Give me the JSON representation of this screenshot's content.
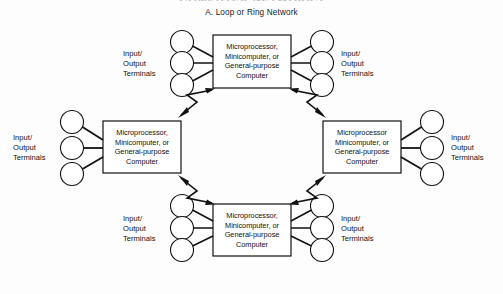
{
  "figure": {
    "title": "COMPUTER NETWORKS",
    "subtitle": "A.  Loop or Ring Network",
    "background_color": "#fdfdfd",
    "stroke_color": "#111111"
  },
  "nodes": [
    {
      "id": "top",
      "position": "top",
      "lines": [
        "Microprocessor,",
        "Minicomputer, or",
        "General-purpose",
        "Computer"
      ],
      "text": "Microprocessor, Minicomputer, or General-purpose Computer"
    },
    {
      "id": "left",
      "position": "left",
      "lines": [
        "Microprocessor,",
        "Minicomputer, or",
        "General-purpose",
        "Computer"
      ],
      "text": "Microprocessor, Minicomputer, or General-purpose Computer"
    },
    {
      "id": "right",
      "position": "right",
      "lines": [
        "Microprocessor",
        "Minicomputer, or",
        "General-purpose",
        "Computer"
      ],
      "text": "Microprocessor Minicomputer, or General-purpose Computer"
    },
    {
      "id": "bottom",
      "position": "bottom",
      "lines": [
        "Microprocessor,",
        "Minicomputer, or",
        "General-purpose",
        "Computer"
      ],
      "text": "Microprocessor, Minicomputer, or General-purpose Computer"
    }
  ],
  "terminal_groups": [
    {
      "id": "top-left",
      "lines": [
        "Input/",
        "Output",
        "Terminals"
      ],
      "terminal_count": 3
    },
    {
      "id": "top-right",
      "lines": [
        "Input/",
        "Output",
        "Terminals"
      ],
      "terminal_count": 3
    },
    {
      "id": "left",
      "lines": [
        "Input/",
        "Output",
        "Terminals"
      ],
      "terminal_count": 3
    },
    {
      "id": "right",
      "lines": [
        "Input/",
        "Output",
        "Terminals"
      ],
      "terminal_count": 3
    },
    {
      "id": "bottom-left",
      "lines": [
        "Input/",
        "Output",
        "Terminals"
      ],
      "terminal_count": 3
    },
    {
      "id": "bottom-right",
      "lines": [
        "Input/",
        "Output",
        "Terminals"
      ],
      "terminal_count": 3
    }
  ],
  "ring_links": [
    {
      "id": "top-left-link",
      "from": "top",
      "to": "left",
      "style": "zigzag-double-arrow"
    },
    {
      "id": "top-right-link",
      "from": "top",
      "to": "right",
      "style": "zigzag-double-arrow"
    },
    {
      "id": "bottom-left-link",
      "from": "left",
      "to": "bottom",
      "style": "zigzag-double-arrow"
    },
    {
      "id": "bottom-right-link",
      "from": "bottom",
      "to": "right",
      "style": "zigzag-double-arrow"
    }
  ]
}
